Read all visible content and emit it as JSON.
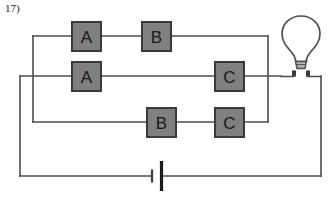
{
  "question": {
    "number": "17)"
  },
  "diagram": {
    "type": "electrical-circuit-schematic",
    "colors": {
      "wire": "#4d4d4d",
      "box_fill": "#808080",
      "box_stroke": "#3a3a3a",
      "label_text": "#1a1a1a",
      "bulb_stroke": "#4d4d4d",
      "bulb_base_fill": "#b3b3b3",
      "background": "#ffffff"
    },
    "switches": [
      {
        "label": "A",
        "row": "top",
        "x": 72,
        "y": 22,
        "w": 29,
        "h": 29
      },
      {
        "label": "B",
        "row": "top",
        "x": 142,
        "y": 22,
        "w": 29,
        "h": 29
      },
      {
        "label": "A",
        "row": "middle",
        "x": 72,
        "y": 62,
        "w": 29,
        "h": 29
      },
      {
        "label": "C",
        "row": "middle",
        "x": 215,
        "y": 62,
        "w": 29,
        "h": 29
      },
      {
        "label": "B",
        "row": "bottom",
        "x": 147,
        "y": 108,
        "w": 29,
        "h": 29
      },
      {
        "label": "C",
        "row": "bottom",
        "x": 215,
        "y": 108,
        "w": 29,
        "h": 29
      }
    ],
    "components": [
      {
        "name": "lamp",
        "label": "light-bulb",
        "cx": 301,
        "cy": 40
      },
      {
        "name": "battery",
        "label": "battery-cell",
        "cx": 157,
        "cy": 176
      }
    ],
    "rows": {
      "top_y": 36,
      "middle_y": 76,
      "bottom_y": 122,
      "bottom_rail_y": 176
    },
    "rails": {
      "left_inner_x": 33,
      "left_outer_x": 20,
      "right_inner_x": 268,
      "right_outer_x": 305
    }
  }
}
